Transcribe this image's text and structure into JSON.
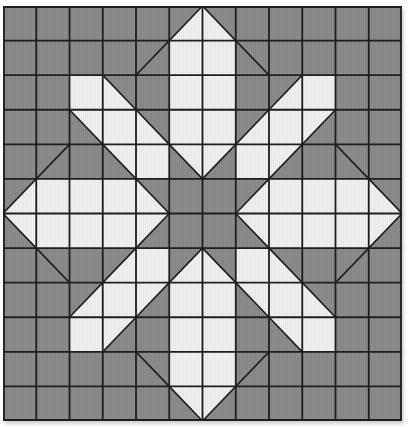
{
  "title": "Star flower quilt block pattern",
  "grid": {
    "rows": 12,
    "cols": 12,
    "colors": {
      "gray": "#8c8c8c",
      "white": "#f2f2f2",
      "line": "#1e1e1e"
    },
    "legend": {
      "G": "gray square",
      "W": "white square",
      "S/": "gray square with diagonal line (bottom-left to top-right)",
      "S\\": "gray square with diagonal line (top-left to bottom-right)",
      "tl": "half-square triangle, white top-left half, diagonal /",
      "br": "half-square triangle, white bottom-right half, diagonal /",
      "tr": "half-square triangle, white top-right half, diagonal \\",
      "bl": "half-square triangle, white bottom-left half, diagonal \\"
    },
    "cells": [
      [
        "G",
        "G",
        "G",
        "G",
        "G",
        "br",
        "bl",
        "G",
        "G",
        "G",
        "G",
        "G"
      ],
      [
        "G",
        "G",
        "G",
        "G",
        "S/",
        "W",
        "W",
        "S\\",
        "G",
        "G",
        "G",
        "G"
      ],
      [
        "G",
        "G",
        "W",
        "bl",
        "G",
        "W",
        "W",
        "G",
        "br",
        "W",
        "G",
        "G"
      ],
      [
        "G",
        "G",
        "tr",
        "W",
        "bl",
        "W",
        "W",
        "br",
        "W",
        "tl",
        "G",
        "G"
      ],
      [
        "G",
        "S/",
        "G",
        "tr",
        "W",
        "tr",
        "tl",
        "W",
        "tl",
        "G",
        "S\\",
        "G"
      ],
      [
        "br",
        "W",
        "W",
        "W",
        "bl",
        "G",
        "G",
        "br",
        "W",
        "W",
        "W",
        "bl"
      ],
      [
        "tr",
        "W",
        "W",
        "W",
        "tl",
        "G",
        "G",
        "tr",
        "W",
        "W",
        "W",
        "tl"
      ],
      [
        "G",
        "S\\",
        "G",
        "br",
        "W",
        "br",
        "bl",
        "W",
        "bl",
        "G",
        "S/",
        "G"
      ],
      [
        "G",
        "G",
        "br",
        "W",
        "tl",
        "W",
        "W",
        "tr",
        "W",
        "bl",
        "G",
        "G"
      ],
      [
        "G",
        "G",
        "W",
        "tl",
        "G",
        "W",
        "W",
        "G",
        "tr",
        "W",
        "G",
        "G"
      ],
      [
        "G",
        "G",
        "G",
        "G",
        "S\\",
        "W",
        "W",
        "S/",
        "G",
        "G",
        "G",
        "G"
      ],
      [
        "G",
        "G",
        "G",
        "G",
        "G",
        "tr",
        "tl",
        "G",
        "G",
        "G",
        "G",
        "G"
      ]
    ]
  }
}
